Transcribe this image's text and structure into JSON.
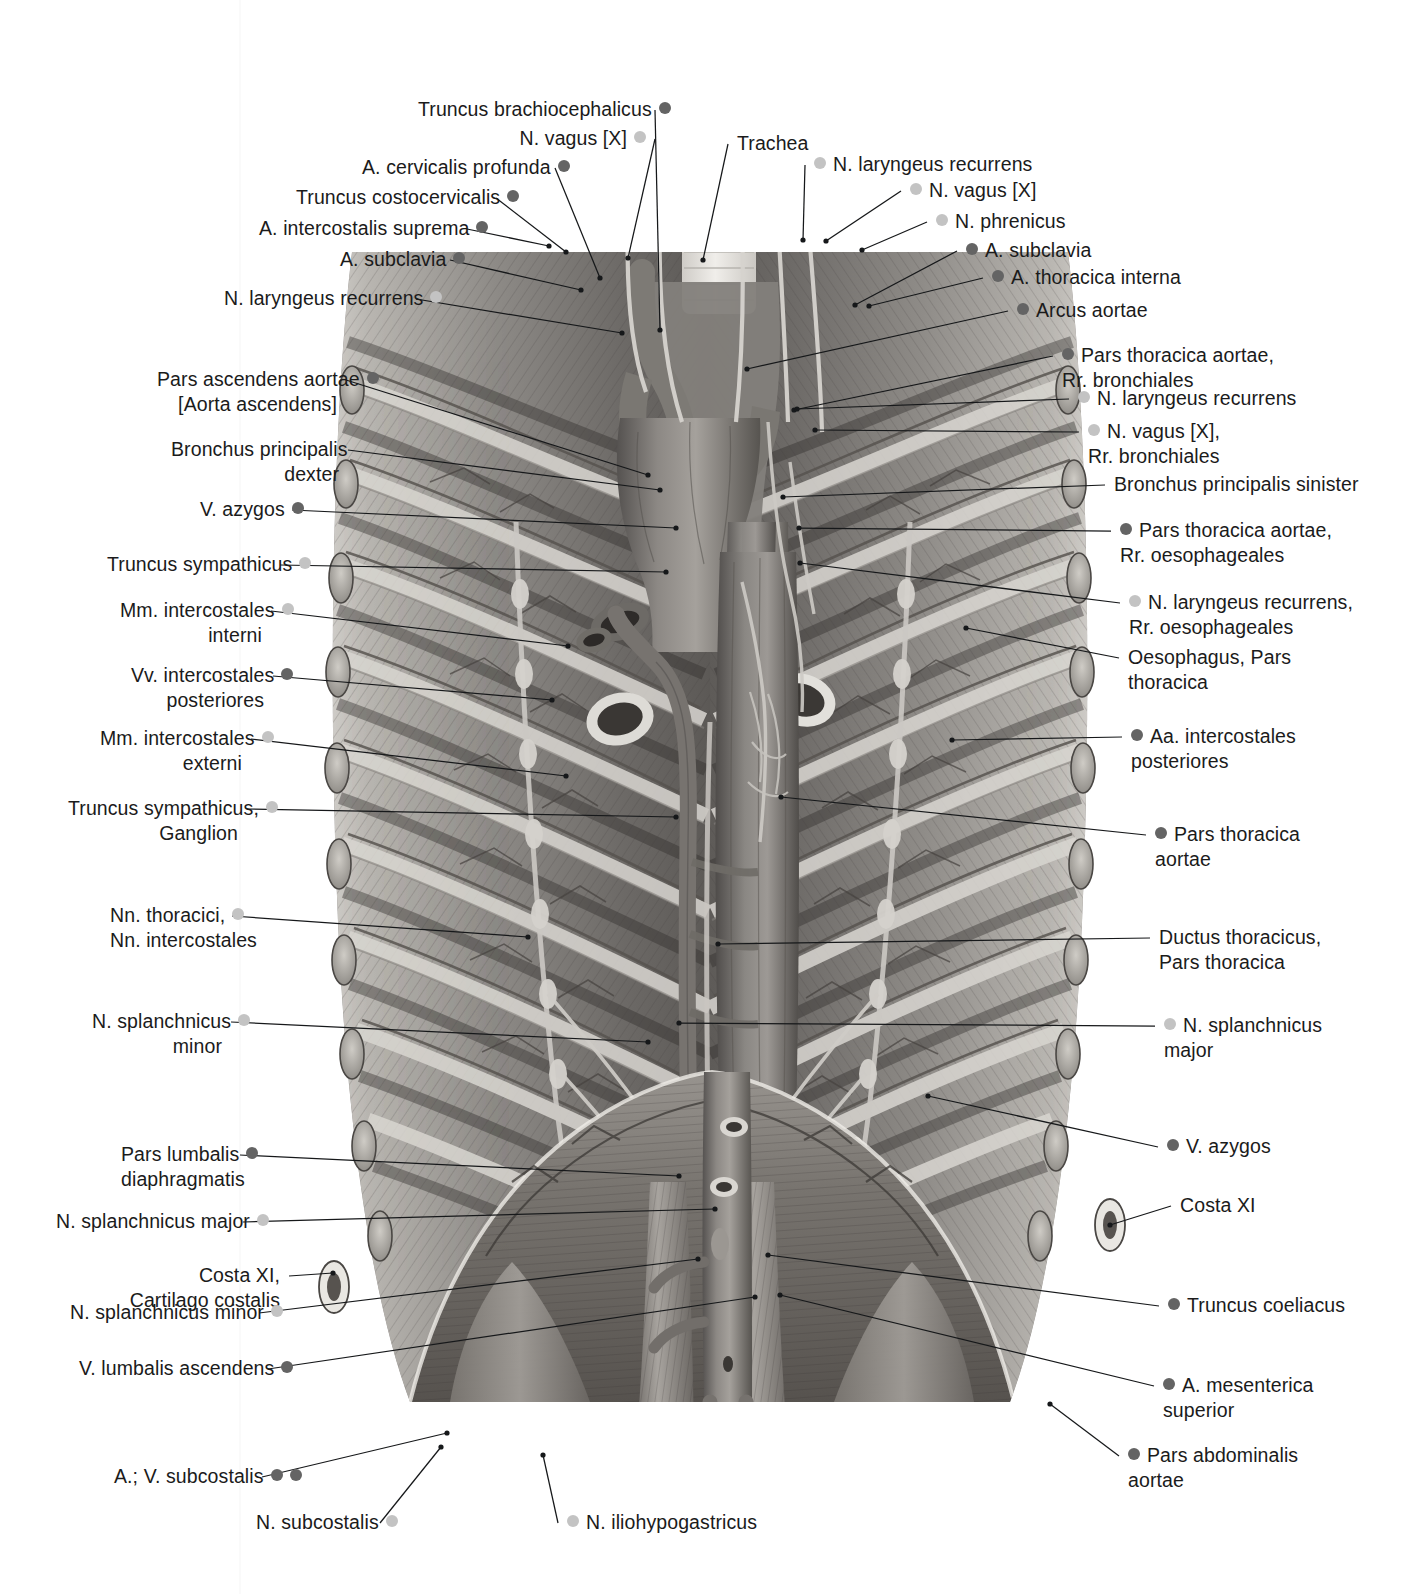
{
  "figure": {
    "colors": {
      "bullet_dark": "#646464",
      "bullet_light": "#c3c3c3",
      "leader": "#16181a",
      "text": "#1b1b1b"
    }
  },
  "labels_left": [
    {
      "id": "truncus-brachiocephalicus",
      "lines": [
        "Truncus brachiocephalicus"
      ],
      "bullets": [
        "dark"
      ],
      "x": 418,
      "y": 97,
      "w": 228,
      "anchor": [
        660,
        330
      ]
    },
    {
      "id": "n-vagus-x-left",
      "lines": [
        "N. vagus [X]"
      ],
      "bullets": [
        "light"
      ],
      "x": 475,
      "y": 126,
      "w": 171,
      "anchor": [
        628,
        258
      ]
    },
    {
      "id": "a-cervicalis-profunda",
      "lines": [
        "A. cervicalis profunda"
      ],
      "bullets": [
        "dark"
      ],
      "x": 362,
      "y": 155,
      "w": 184,
      "anchor": [
        600,
        278
      ]
    },
    {
      "id": "truncus-costocervicalis",
      "lines": [
        "Truncus costocervicalis"
      ],
      "bullets": [
        "dark"
      ],
      "x": 296,
      "y": 185,
      "w": 191,
      "anchor": [
        566,
        252
      ]
    },
    {
      "id": "a-intercostalis-suprema",
      "lines": [
        "A. intercostalis suprema"
      ],
      "bullets": [
        "dark"
      ],
      "x": 259,
      "y": 216,
      "w": 199,
      "anchor": [
        549,
        246
      ]
    },
    {
      "id": "a-subclavia-left",
      "lines": [
        "A. subclavia"
      ],
      "bullets": [
        "dark"
      ],
      "x": 340,
      "y": 247,
      "w": 101,
      "anchor": [
        581,
        290
      ]
    },
    {
      "id": "n-laryngeus-recurrens-left-1",
      "lines": [
        "N. laryngeus recurrens"
      ],
      "bullets": [
        "light"
      ],
      "x": 224,
      "y": 286,
      "w": 183,
      "anchor": [
        622,
        333
      ]
    },
    {
      "id": "pars-ascendens-aortae",
      "lines": [
        "Pars ascendens aortae",
        "[Aorta ascendens]"
      ],
      "bullets": [
        "dark"
      ],
      "x": 157,
      "y": 367,
      "w": 180,
      "anchor": [
        648,
        475
      ]
    },
    {
      "id": "bronchus-principalis-dexter",
      "lines": [
        "Bronchus principalis",
        "dexter"
      ],
      "bullets": [],
      "x": 171,
      "y": 437,
      "w": 168,
      "anchor": [
        660,
        490
      ]
    },
    {
      "id": "v-azygos-left",
      "lines": [
        "V. azygos"
      ],
      "bullets": [
        "dark"
      ],
      "x": 200,
      "y": 497,
      "w": 83,
      "anchor": [
        676,
        528
      ]
    },
    {
      "id": "truncus-sympathicus",
      "lines": [
        "Truncus sympathicus"
      ],
      "bullets": [
        "light"
      ],
      "x": 107,
      "y": 552,
      "w": 164,
      "anchor": [
        666,
        572
      ]
    },
    {
      "id": "mm-intercostales-interni",
      "lines": [
        "Mm. intercostales",
        "interni"
      ],
      "bullets": [
        "light"
      ],
      "x": 120,
      "y": 598,
      "w": 142,
      "anchor": [
        568,
        646
      ]
    },
    {
      "id": "vv-intercostales-posteriores",
      "lines": [
        "Vv. intercostales",
        "posteriores"
      ],
      "bullets": [
        "dark"
      ],
      "x": 131,
      "y": 663,
      "w": 133,
      "anchor": [
        552,
        700
      ]
    },
    {
      "id": "mm-intercostales-externi",
      "lines": [
        "Mm. intercostales",
        "externi"
      ],
      "bullets": [
        "light"
      ],
      "x": 100,
      "y": 726,
      "w": 142,
      "anchor": [
        566,
        776
      ]
    },
    {
      "id": "truncus-sympathicus-ganglion",
      "lines": [
        "Truncus sympathicus,",
        "Ganglion"
      ],
      "bullets": [
        "light"
      ],
      "x": 68,
      "y": 796,
      "w": 170,
      "anchor": [
        676,
        817
      ]
    },
    {
      "id": "nn-thoracici-intercostales",
      "lines": [
        "Nn. thoracici,",
        "Nn. intercostales"
      ],
      "bullets": [
        "light"
      ],
      "x": 110,
      "y": 903,
      "w": 113,
      "anchor": [
        528,
        937
      ]
    },
    {
      "id": "n-splanchnicus-minor-left",
      "lines": [
        "N. splanchnicus",
        "minor"
      ],
      "bullets": [
        "light"
      ],
      "x": 92,
      "y": 1009,
      "w": 130,
      "anchor": [
        648,
        1042
      ]
    },
    {
      "id": "pars-lumbalis-diaphragmatis",
      "lines": [
        "Pars lumbalis",
        "diaphragmatis"
      ],
      "bullets": [
        "dark"
      ],
      "x": 121,
      "y": 1142,
      "w": 110,
      "anchor": [
        679,
        1176
      ]
    },
    {
      "id": "n-splanchnicus-major-left",
      "lines": [
        "N. splanchnicus major"
      ],
      "bullets": [
        "light"
      ],
      "x": 56,
      "y": 1209,
      "w": 178,
      "anchor": [
        715,
        1209
      ]
    },
    {
      "id": "costa-xi-cartilago-costalis",
      "lines": [
        "Costa XI,",
        "Cartilago costalis"
      ],
      "bullets": [],
      "x": 120,
      "y": 1263,
      "w": 160,
      "anchor": [
        333,
        1273
      ]
    },
    {
      "id": "n-splanchnicus-minor-left-2",
      "lines": [
        "N. splanchnicus minor"
      ],
      "bullets": [
        "light"
      ],
      "x": 70,
      "y": 1300,
      "w": 180,
      "anchor": [
        698,
        1259
      ]
    },
    {
      "id": "v-lumbalis-ascendens",
      "lines": [
        "V. lumbalis ascendens"
      ],
      "bullets": [
        "dark"
      ],
      "x": 79,
      "y": 1356,
      "w": 180,
      "anchor": [
        755,
        1297
      ]
    },
    {
      "id": "a-v-subcostalis",
      "lines": [
        "A.; V. subcostalis"
      ],
      "bullets": [
        "dark",
        "dark"
      ],
      "x": 114,
      "y": 1464,
      "w": 139,
      "anchor": [
        447,
        1433
      ]
    },
    {
      "id": "n-subcostalis",
      "lines": [
        "N. subcostalis"
      ],
      "bullets": [
        "light"
      ],
      "x": 256,
      "y": 1510,
      "w": 115,
      "anchor": [
        441,
        1447
      ]
    }
  ],
  "labels_right": [
    {
      "id": "trachea",
      "lines": [
        "Trachea"
      ],
      "bullets": [],
      "x": 737,
      "y": 131,
      "anchor": [
        703,
        260
      ]
    },
    {
      "id": "n-laryngeus-recurrens-right-1",
      "lines": [
        "N. laryngeus recurrens"
      ],
      "bullets": [
        "light"
      ],
      "x": 814,
      "y": 152,
      "anchor": [
        803,
        240
      ]
    },
    {
      "id": "n-vagus-x-right",
      "lines": [
        "N. vagus [X]"
      ],
      "bullets": [
        "light"
      ],
      "x": 910,
      "y": 178,
      "anchor": [
        826,
        241
      ]
    },
    {
      "id": "n-phrenicus",
      "lines": [
        "N. phrenicus"
      ],
      "bullets": [
        "light"
      ],
      "x": 936,
      "y": 209,
      "anchor": [
        862,
        250
      ]
    },
    {
      "id": "a-subclavia-right",
      "lines": [
        "A. subclavia"
      ],
      "bullets": [
        "dark"
      ],
      "x": 966,
      "y": 238,
      "anchor": [
        855,
        305
      ]
    },
    {
      "id": "a-thoracica-interna",
      "lines": [
        "A. thoracica interna"
      ],
      "bullets": [
        "dark"
      ],
      "x": 992,
      "y": 265,
      "anchor": [
        869,
        306
      ]
    },
    {
      "id": "arcus-aortae",
      "lines": [
        "Arcus aortae"
      ],
      "bullets": [
        "dark"
      ],
      "x": 1017,
      "y": 298,
      "anchor": [
        747,
        369
      ]
    },
    {
      "id": "pars-thoracica-aortae-rr-bronchiales",
      "lines": [
        "Pars thoracica aortae,",
        "Rr. bronchiales"
      ],
      "bullets": [
        "dark"
      ],
      "x": 1062,
      "y": 343,
      "anchor": [
        794,
        410
      ]
    },
    {
      "id": "n-laryngeus-recurrens-right-2",
      "lines": [
        "N. laryngeus recurrens"
      ],
      "bullets": [
        "light"
      ],
      "x": 1078,
      "y": 386,
      "anchor": [
        797,
        409
      ]
    },
    {
      "id": "n-vagus-x-rr-bronchiales",
      "lines": [
        "N. vagus [X],",
        "Rr. bronchiales"
      ],
      "bullets": [
        "light"
      ],
      "x": 1088,
      "y": 419,
      "anchor": [
        815,
        430
      ]
    },
    {
      "id": "bronchus-principalis-sinister",
      "lines": [
        "Bronchus principalis sinister"
      ],
      "bullets": [],
      "x": 1114,
      "y": 472,
      "anchor": [
        783,
        497
      ]
    },
    {
      "id": "pars-thoracica-aortae-rr-oesophageales",
      "lines": [
        "Pars thoracica aortae,",
        "Rr. oesophageales"
      ],
      "bullets": [
        "dark"
      ],
      "x": 1120,
      "y": 518,
      "anchor": [
        799,
        528
      ]
    },
    {
      "id": "n-laryngeus-recurrens-rr-oesophageales",
      "lines": [
        "N. laryngeus recurrens,",
        "Rr. oesophageales"
      ],
      "bullets": [
        "light"
      ],
      "x": 1129,
      "y": 590,
      "anchor": [
        800,
        563
      ]
    },
    {
      "id": "oesophagus-pars-thoracica",
      "lines": [
        "Oesophagus, Pars",
        "thoracica"
      ],
      "bullets": [],
      "x": 1128,
      "y": 645,
      "anchor": [
        966,
        628
      ]
    },
    {
      "id": "aa-intercostales-posteriores",
      "lines": [
        "Aa. intercostales",
        "posteriores"
      ],
      "bullets": [
        "dark"
      ],
      "x": 1131,
      "y": 724,
      "anchor": [
        952,
        740
      ]
    },
    {
      "id": "pars-thoracica-aortae",
      "lines": [
        "Pars thoracica",
        "aortae"
      ],
      "bullets": [
        "dark"
      ],
      "x": 1155,
      "y": 822,
      "anchor": [
        781,
        797
      ]
    },
    {
      "id": "ductus-thoracicus-pars-thoracica",
      "lines": [
        "Ductus thoracicus,",
        "Pars thoracica"
      ],
      "bullets": [],
      "x": 1159,
      "y": 925,
      "anchor": [
        718,
        944
      ]
    },
    {
      "id": "n-splanchnicus-major-right",
      "lines": [
        "N. splanchnicus",
        "major"
      ],
      "bullets": [
        "light"
      ],
      "x": 1164,
      "y": 1013,
      "anchor": [
        679,
        1023
      ]
    },
    {
      "id": "v-azygos-right",
      "lines": [
        "V. azygos"
      ],
      "bullets": [
        "dark"
      ],
      "x": 1167,
      "y": 1134,
      "anchor": [
        928,
        1096
      ]
    },
    {
      "id": "costa-xi-right",
      "lines": [
        "Costa XI"
      ],
      "bullets": [],
      "x": 1180,
      "y": 1193,
      "anchor": [
        1110,
        1225
      ]
    },
    {
      "id": "truncus-coeliacus",
      "lines": [
        "Truncus coeliacus"
      ],
      "bullets": [
        "dark"
      ],
      "x": 1168,
      "y": 1293,
      "anchor": [
        768,
        1255
      ]
    },
    {
      "id": "a-mesenterica-superior",
      "lines": [
        "A. mesenterica",
        "superior"
      ],
      "bullets": [
        "dark"
      ],
      "x": 1163,
      "y": 1373,
      "anchor": [
        780,
        1295
      ]
    },
    {
      "id": "pars-abdominalis-aortae",
      "lines": [
        "Pars abdominalis",
        "aortae"
      ],
      "bullets": [
        "dark"
      ],
      "x": 1128,
      "y": 1443,
      "anchor": [
        1050,
        1404
      ]
    }
  ],
  "labels_bottom": [
    {
      "id": "n-iliohypogastricus",
      "lines": [
        "N. iliohypogastricus"
      ],
      "bullets": [
        "light"
      ],
      "x": 567,
      "y": 1510,
      "anchor": [
        543,
        1455
      ]
    }
  ]
}
